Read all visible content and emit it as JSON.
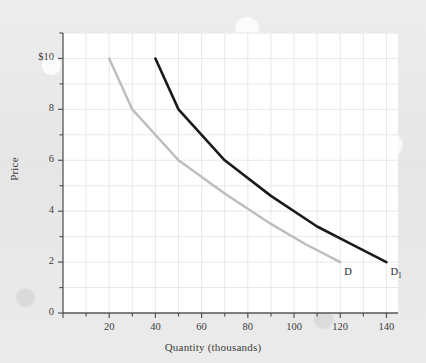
{
  "chart_data": {
    "type": "line",
    "title": "",
    "xlabel": "Quantity (thousands)",
    "ylabel": "Price",
    "xlim": [
      0,
      145
    ],
    "ylim": [
      0,
      11
    ],
    "xticks": [
      0,
      20,
      40,
      60,
      80,
      100,
      120,
      140
    ],
    "xticklabels": [
      "",
      "20",
      "40",
      "60",
      "80",
      "100",
      "120",
      "140"
    ],
    "x_minor_ticks": [
      10,
      30,
      50,
      70,
      90,
      110,
      130
    ],
    "yticks": [
      0,
      2,
      4,
      6,
      8,
      10
    ],
    "yticklabels": [
      "0",
      "2",
      "4",
      "6",
      "8",
      "$10"
    ],
    "y_minor_ticks": [
      1,
      3,
      5,
      7,
      9,
      11
    ],
    "grid": true,
    "legend_position": "inline-at-curve-end",
    "series": [
      {
        "name": "D",
        "label": "D",
        "color": "#bdbdbd",
        "points": [
          {
            "x": 20,
            "y": 10
          },
          {
            "x": 30,
            "y": 8
          },
          {
            "x": 50,
            "y": 6
          },
          {
            "x": 70,
            "y": 4.7
          },
          {
            "x": 90,
            "y": 3.5
          },
          {
            "x": 105,
            "y": 2.7
          },
          {
            "x": 120,
            "y": 2
          }
        ]
      },
      {
        "name": "D1",
        "label": "D",
        "label_subscript": "1",
        "color": "#1a1a1a",
        "points": [
          {
            "x": 40,
            "y": 10
          },
          {
            "x": 50,
            "y": 8
          },
          {
            "x": 70,
            "y": 6
          },
          {
            "x": 90,
            "y": 4.6
          },
          {
            "x": 110,
            "y": 3.4
          },
          {
            "x": 125,
            "y": 2.7
          },
          {
            "x": 140,
            "y": 2
          }
        ]
      }
    ]
  },
  "colors": {
    "page_background": "#e9e8e8",
    "plot_background": "#ffffff",
    "axis": "#555555",
    "grid": "#e6e6ee",
    "text": "#3b3b3b",
    "curve_d": "#bdbdbd",
    "curve_d1": "#1a1a1a"
  }
}
